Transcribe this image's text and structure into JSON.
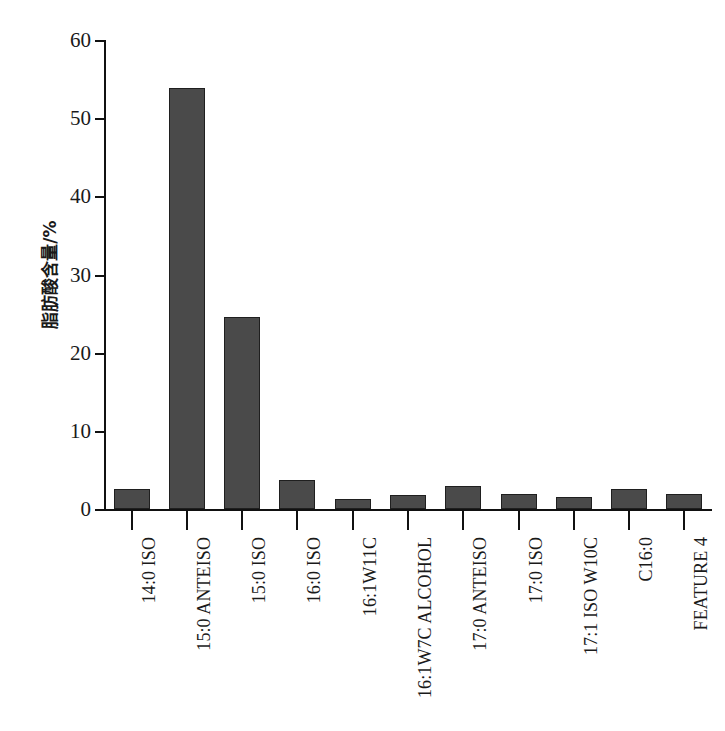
{
  "chart_data": {
    "type": "bar",
    "title": "",
    "subtitle": "",
    "xlabel": "",
    "ylabel": "脂肪酸含量/%",
    "ylim": [
      0,
      60
    ],
    "ytick_values": [
      0,
      10,
      20,
      30,
      40,
      50,
      60
    ],
    "ytick_labels": [
      "0",
      "10",
      "20",
      "30",
      "40",
      "50",
      "60"
    ],
    "grid": false,
    "legend": null,
    "bar_color": "#4a4a4a",
    "bar_edge_color": "#1f1f1f",
    "categories": [
      "14:0 ISO",
      "15:0 ANTEISO",
      "15:0 ISO",
      "16:0 ISO",
      "16:1W11C",
      "16:1W7C ALCOHOL",
      "17:0 ANTEISO",
      "17:0 ISO",
      "17:1 ISO W10C",
      "C16:0",
      "FEATURE 4"
    ],
    "values": [
      2.6,
      53.9,
      24.6,
      3.7,
      1.3,
      1.8,
      2.9,
      1.9,
      1.5,
      2.5,
      1.9
    ]
  }
}
